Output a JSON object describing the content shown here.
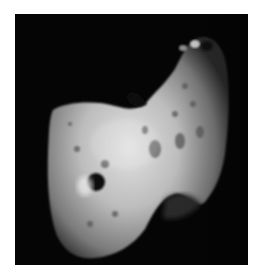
{
  "image": {
    "subject": "asteroid",
    "alt": "Asteroid against black space background",
    "colors": {
      "background": "#ffffff",
      "space": "#050505",
      "surface_light": "#d8d8d8",
      "surface_mid": "#9a9a9a",
      "surface_dark": "#3a3a3a"
    }
  }
}
